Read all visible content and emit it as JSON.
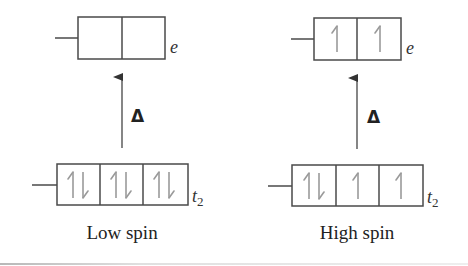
{
  "diagram": {
    "type": "crystal-field-splitting",
    "colors": {
      "box_stroke": "#4a4a4a",
      "electron_arrow": "#9a9a9a",
      "gap_arrow": "#444444",
      "text": "#222222"
    },
    "panels": [
      {
        "id": "low-spin",
        "caption": "Low spin",
        "gap_label": "Δ",
        "upper_level": {
          "label": "e",
          "orbitals": [
            "",
            ""
          ]
        },
        "lower_level": {
          "label": "t",
          "label_subscript": "2",
          "orbitals": [
            "up-down",
            "up-down",
            "up-down"
          ]
        }
      },
      {
        "id": "high-spin",
        "caption": "High spin",
        "gap_label": "Δ",
        "upper_level": {
          "label": "e",
          "orbitals": [
            "up",
            "up"
          ]
        },
        "lower_level": {
          "label": "t",
          "label_subscript": "2",
          "orbitals": [
            "up-down",
            "up",
            "up"
          ]
        }
      }
    ]
  }
}
